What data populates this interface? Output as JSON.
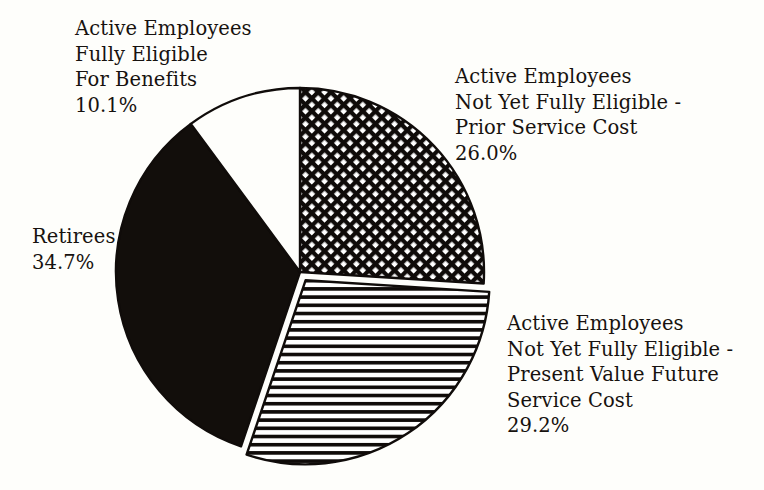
{
  "chart_data": {
    "type": "pie",
    "title": "",
    "subtitle": "",
    "xlabel": "",
    "ylabel": "",
    "legend_position": "none",
    "grid": false,
    "units": "percent",
    "total": 100.0,
    "categories": [
      "Active Employees Not Yet Fully Eligible - Prior Service Cost",
      "Active Employees Not Yet Fully Eligible - Present Value Future Service Cost",
      "Retirees",
      "Active Employees Fully Eligible For Benefits"
    ],
    "values": [
      26.0,
      29.2,
      34.7,
      10.1
    ],
    "slices": [
      {
        "name": "prior-service-cost",
        "label_lines": [
          "Active Employees",
          "Not Yet Fully Eligible -",
          "Prior Service Cost"
        ],
        "percent_text": "26.0%",
        "value": 26.0,
        "fill": "crosshatch",
        "fill_color": "#ffffff",
        "stroke_color": "#100c0a",
        "exploded": false,
        "start_angle_deg": 0.0,
        "end_angle_deg": 93.6
      },
      {
        "name": "present-value-future-service-cost",
        "label_lines": [
          "Active Employees",
          "Not Yet Fully Eligible -",
          "Present Value Future",
          "Service Cost"
        ],
        "percent_text": "29.2%",
        "value": 29.2,
        "fill": "horizontal-lines",
        "fill_color": "#ffffff",
        "stroke_color": "#100c0a",
        "exploded": true,
        "start_angle_deg": 93.6,
        "end_angle_deg": 198.7
      },
      {
        "name": "retirees",
        "label_lines": [
          "Retirees"
        ],
        "percent_text": "34.7%",
        "value": 34.7,
        "fill": "solid-black",
        "fill_color": "#120e0b",
        "stroke_color": "#100c0a",
        "exploded": false,
        "start_angle_deg": 198.7,
        "end_angle_deg": 323.6
      },
      {
        "name": "fully-eligible-for-benefits",
        "label_lines": [
          "Active Employees",
          "Fully Eligible",
          "For Benefits"
        ],
        "percent_text": "10.1%",
        "value": 10.1,
        "fill": "solid-white",
        "fill_color": "#fefefb",
        "stroke_color": "#100c0a",
        "exploded": false,
        "start_angle_deg": 323.6,
        "end_angle_deg": 360.0
      }
    ]
  },
  "labels": {
    "fully_eligible": {
      "line1": "Active Employees",
      "line2": "Fully Eligible",
      "line3": "For Benefits",
      "percent": "10.1%"
    },
    "prior_service": {
      "line1": "Active Employees",
      "line2": "Not Yet Fully Eligible -",
      "line3": "Prior Service Cost",
      "percent": "26.0%"
    },
    "present_value": {
      "line1": "Active Employees",
      "line2": "Not Yet Fully Eligible -",
      "line3": "Present Value Future",
      "line4": "Service Cost",
      "percent": "29.2%"
    },
    "retirees": {
      "line1": "Retirees",
      "percent": "34.7%"
    }
  },
  "colors": {
    "background": "#fefefb",
    "ink": "#17120f",
    "slice_black": "#120e0b",
    "slice_white": "#fefefb",
    "outline": "#100c0a"
  },
  "geometry": {
    "center_x": 300,
    "center_y": 272,
    "radius": 184,
    "explode_offset": 10
  }
}
